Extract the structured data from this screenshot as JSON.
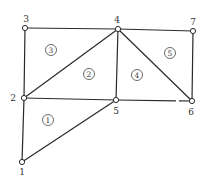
{
  "diagram": {
    "type": "finite-element-mesh",
    "nodes": [
      {
        "id": "1",
        "x": 22,
        "y": 162,
        "lx": 22,
        "ly": 175
      },
      {
        "id": "2",
        "x": 24,
        "y": 98,
        "lx": 13,
        "ly": 101
      },
      {
        "id": "3",
        "x": 25,
        "y": 28,
        "lx": 26,
        "ly": 22
      },
      {
        "id": "4",
        "x": 118,
        "y": 29,
        "lx": 117,
        "ly": 23
      },
      {
        "id": "5",
        "x": 116,
        "y": 100,
        "lx": 116,
        "ly": 114
      },
      {
        "id": "6",
        "x": 192,
        "y": 101,
        "lx": 191,
        "ly": 115
      },
      {
        "id": "7",
        "x": 193,
        "y": 31,
        "lx": 193,
        "ly": 25
      }
    ],
    "edges": [
      [
        "1",
        "2"
      ],
      [
        "1",
        "5"
      ],
      [
        "2",
        "5"
      ],
      [
        "2",
        "3"
      ],
      [
        "2",
        "4"
      ],
      [
        "3",
        "4"
      ],
      [
        "4",
        "5"
      ],
      [
        "4",
        "6"
      ],
      [
        "4",
        "7"
      ],
      [
        "5",
        "6"
      ],
      [
        "6",
        "7"
      ]
    ],
    "elements": [
      {
        "id": "1",
        "nodes": [
          "1",
          "5",
          "2"
        ],
        "x": 48,
        "y": 120
      },
      {
        "id": "2",
        "nodes": [
          "2",
          "5",
          "4"
        ],
        "x": 89,
        "y": 74
      },
      {
        "id": "3",
        "nodes": [
          "2",
          "4",
          "3"
        ],
        "x": 51,
        "y": 50
      },
      {
        "id": "4",
        "nodes": [
          "5",
          "6",
          "4"
        ],
        "x": 137,
        "y": 75
      },
      {
        "id": "5",
        "nodes": [
          "4",
          "6",
          "7"
        ],
        "x": 170,
        "y": 53
      }
    ]
  }
}
